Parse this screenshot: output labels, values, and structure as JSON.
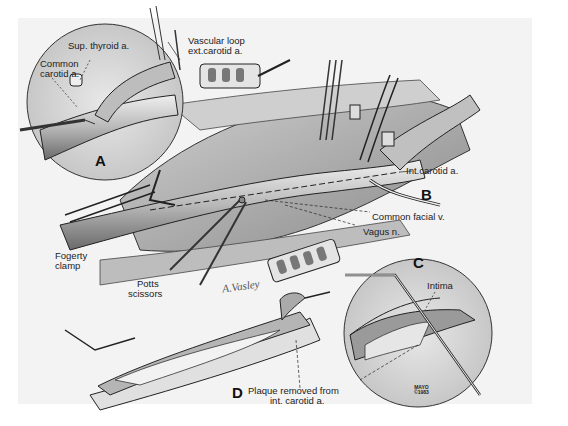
{
  "figure": {
    "panels": [
      {
        "letter": "A",
        "type": "inset-circle"
      },
      {
        "letter": "B",
        "type": "main-view"
      },
      {
        "letter": "C",
        "type": "inset-circle"
      },
      {
        "letter": "D",
        "type": "detail-view"
      }
    ],
    "labels": {
      "sup_thyroid": "Sup. thyroid a.",
      "common_carotid_1": "Common",
      "common_carotid_2": "carotid a.",
      "vascular_loop_1": "Vascular loop",
      "vascular_loop_2": "ext.carotid a.",
      "int_carotid": "Int.carotid a.",
      "common_facial": "Common facial v.",
      "vagus": "Vagus n.",
      "fogerty_1": "Fogerty",
      "fogerty_2": "clamp",
      "potts_1": "Potts",
      "potts_2": "scissors",
      "intima": "Intima",
      "plaque_1": "Plaque removed from",
      "plaque_2": "int. carotid a."
    },
    "letters": {
      "a": "A",
      "b": "B",
      "c": "C",
      "d": "D"
    },
    "signature": "A.Vasley",
    "credit": {
      "line1": "MAYO",
      "line2": "©1983"
    }
  },
  "colors": {
    "background": "#ffffff",
    "panel": "#f3f3f3",
    "ink": "#222222",
    "vessel_dark": "#555555",
    "vessel_light": "#d8d8d8"
  }
}
